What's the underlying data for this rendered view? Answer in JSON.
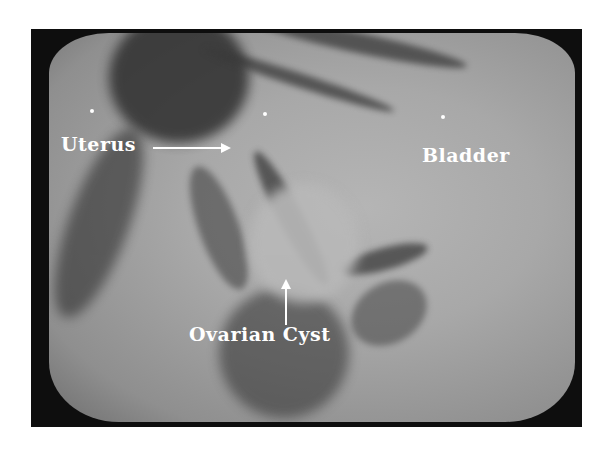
{
  "image": {
    "type": "ultrasound scan photograph",
    "labels": {
      "uterus": "Uterus",
      "bladder": "Bladder",
      "ovarian_cyst": "Ovarian Cyst"
    },
    "markers": [
      {
        "name": "marker-dot-left",
        "x": 92,
        "y": 111
      },
      {
        "name": "marker-dot-center",
        "x": 265,
        "y": 114
      },
      {
        "name": "marker-dot-right",
        "x": 443,
        "y": 117
      }
    ],
    "colors": {
      "border": "#0e0e0e",
      "screen": "#a8a8a8",
      "tissue_dark": "#2e2e2e",
      "label": "#ffffff"
    }
  }
}
